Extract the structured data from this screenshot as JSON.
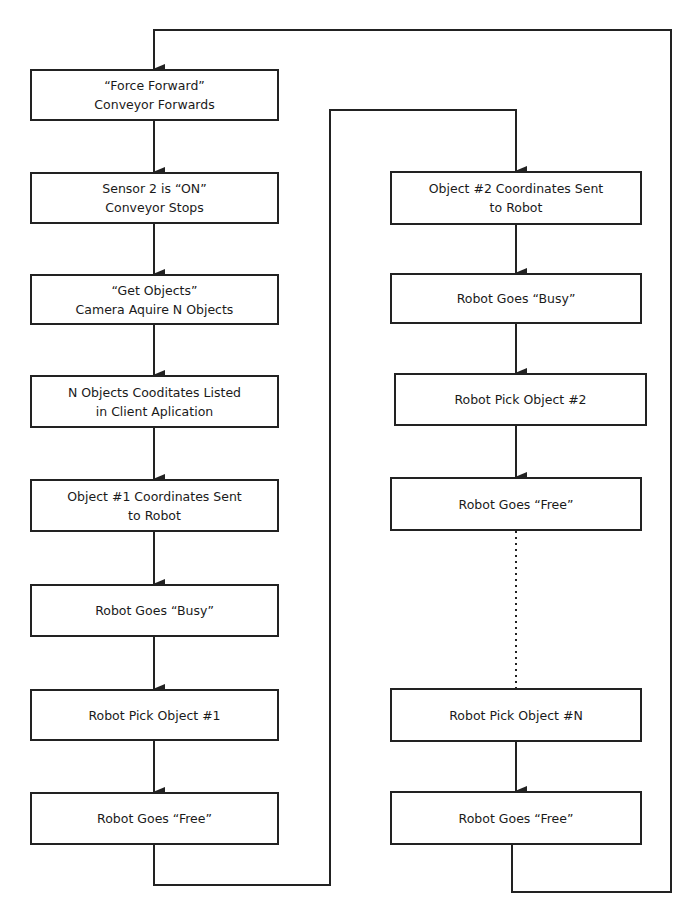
{
  "diagram": {
    "type": "flowchart",
    "left_column": [
      {
        "id": "force-forward",
        "lines": [
          "“Force Forward”",
          "Conveyor Forwards"
        ]
      },
      {
        "id": "sensor-on",
        "lines": [
          "Sensor 2 is “ON”",
          "Conveyor Stops"
        ]
      },
      {
        "id": "get-objects",
        "lines": [
          "“Get Objects”",
          "Camera Aquire N Objects"
        ]
      },
      {
        "id": "coords-listed",
        "lines": [
          "N Objects Cooditates Listed",
          "in Client Aplication"
        ]
      },
      {
        "id": "object1-sent",
        "lines": [
          "Object #1 Coordinates Sent",
          "to Robot"
        ]
      },
      {
        "id": "robot-busy-1",
        "lines": [
          "Robot Goes “Busy”"
        ]
      },
      {
        "id": "robot-pick-1",
        "lines": [
          "Robot Pick Object #1"
        ]
      },
      {
        "id": "robot-free-1",
        "lines": [
          "Robot Goes “Free”"
        ]
      }
    ],
    "right_column": [
      {
        "id": "object2-sent",
        "lines": [
          "Object #2 Coordinates Sent",
          "to Robot"
        ]
      },
      {
        "id": "robot-busy-2",
        "lines": [
          "Robot Goes “Busy”"
        ]
      },
      {
        "id": "robot-pick-2",
        "lines": [
          "Robot Pick Object #2"
        ]
      },
      {
        "id": "robot-free-2",
        "lines": [
          "Robot Goes “Free”"
        ]
      },
      {
        "id": "robot-pick-n",
        "lines": [
          "Robot Pick Object #N"
        ]
      },
      {
        "id": "robot-free-n",
        "lines": [
          "Robot Goes “Free”"
        ]
      }
    ],
    "edges": [
      {
        "from": "force-forward",
        "to": "sensor-on",
        "style": "arrow"
      },
      {
        "from": "sensor-on",
        "to": "get-objects",
        "style": "arrow"
      },
      {
        "from": "get-objects",
        "to": "coords-listed",
        "style": "arrow"
      },
      {
        "from": "coords-listed",
        "to": "object1-sent",
        "style": "arrow"
      },
      {
        "from": "object1-sent",
        "to": "robot-busy-1",
        "style": "arrow"
      },
      {
        "from": "robot-busy-1",
        "to": "robot-pick-1",
        "style": "arrow"
      },
      {
        "from": "robot-pick-1",
        "to": "robot-free-1",
        "style": "arrow"
      },
      {
        "from": "robot-free-1",
        "to": "object2-sent",
        "style": "arrow"
      },
      {
        "from": "object2-sent",
        "to": "robot-busy-2",
        "style": "arrow"
      },
      {
        "from": "robot-busy-2",
        "to": "robot-pick-2",
        "style": "arrow"
      },
      {
        "from": "robot-pick-2",
        "to": "robot-free-2",
        "style": "arrow"
      },
      {
        "from": "robot-free-2",
        "to": "robot-pick-n",
        "style": "dotted"
      },
      {
        "from": "robot-pick-n",
        "to": "robot-free-n",
        "style": "arrow"
      },
      {
        "from": "robot-free-n",
        "to": "force-forward",
        "style": "arrow"
      }
    ],
    "colors": {
      "line": "#222222",
      "box_fill": "#ffffff",
      "background": "#ffffff"
    }
  }
}
